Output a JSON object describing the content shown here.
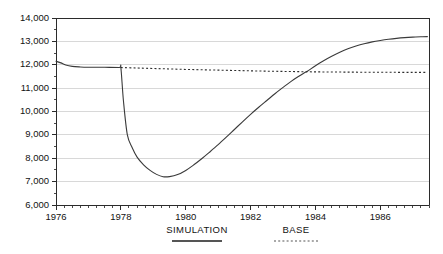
{
  "chart_data": {
    "type": "line",
    "title": "",
    "subtitle": "",
    "xlabel": "",
    "ylabel": "",
    "xlim": [
      1976.0,
      1987.5
    ],
    "ylim": [
      6000,
      14000
    ],
    "grid": true,
    "grid_axis": "y",
    "legend_position": "bottom",
    "y_ticks": [
      6000,
      7000,
      8000,
      9000,
      10000,
      11000,
      12000,
      13000,
      14000
    ],
    "y_tick_labels": [
      "6,000",
      "7,000",
      "8,000",
      "9,000",
      "10,000",
      "11,000",
      "12,000",
      "13,000",
      "14,000"
    ],
    "y_minor_tick_step": 500,
    "x_ticks": [
      1976,
      1978,
      1980,
      1982,
      1984,
      1986
    ],
    "x_tick_labels": [
      "1976",
      "1978",
      "1980",
      "1982",
      "1984",
      "1986"
    ],
    "x_minor_tick_step": 0.25,
    "series": [
      {
        "name": "SIMULATION",
        "style": "solid",
        "color": "#3a3a3a",
        "x": [
          1976.0,
          1976.15,
          1976.3,
          1976.5,
          1976.75,
          1977.0,
          1977.5,
          1977.95,
          1978.0,
          1978.08,
          1978.2,
          1978.35,
          1978.5,
          1978.7,
          1978.9,
          1979.1,
          1979.3,
          1979.5,
          1979.75,
          1980.0,
          1980.25,
          1980.5,
          1980.75,
          1981.0,
          1981.25,
          1981.5,
          1981.75,
          1982.0,
          1982.25,
          1982.5,
          1982.75,
          1983.0,
          1983.25,
          1983.5,
          1983.65,
          1983.75,
          1984.0,
          1984.25,
          1984.5,
          1984.75,
          1985.0,
          1985.25,
          1985.5,
          1985.75,
          1986.0,
          1986.25,
          1986.5,
          1986.75,
          1987.0,
          1987.25,
          1987.45
        ],
        "y": [
          12150,
          12080,
          11990,
          11930,
          11905,
          11895,
          11890,
          11885,
          11880,
          10450,
          9000,
          8450,
          8050,
          7720,
          7480,
          7310,
          7210,
          7215,
          7300,
          7480,
          7720,
          7990,
          8280,
          8580,
          8900,
          9230,
          9560,
          9880,
          10180,
          10470,
          10760,
          11030,
          11290,
          11520,
          11650,
          11720,
          11960,
          12170,
          12360,
          12530,
          12680,
          12800,
          12900,
          12980,
          13040,
          13090,
          13130,
          13160,
          13180,
          13195,
          13205
        ]
      },
      {
        "name": "BASE",
        "style": "dotted",
        "color": "#2e2e2e",
        "x": [
          1978.0,
          1978.5,
          1979.0,
          1979.5,
          1980.0,
          1980.5,
          1981.0,
          1981.5,
          1982.0,
          1982.5,
          1983.0,
          1983.5,
          1984.0,
          1984.5,
          1985.0,
          1985.5,
          1986.0,
          1986.5,
          1987.0,
          1987.45
        ],
        "y": [
          11880,
          11860,
          11840,
          11820,
          11800,
          11785,
          11770,
          11755,
          11740,
          11725,
          11715,
          11705,
          11695,
          11690,
          11685,
          11680,
          11678,
          11676,
          11674,
          11672
        ]
      }
    ],
    "annotations": []
  },
  "legend": {
    "items": [
      {
        "label": "SIMULATION",
        "style": "solid"
      },
      {
        "label": "BASE",
        "style": "dotted"
      }
    ]
  }
}
